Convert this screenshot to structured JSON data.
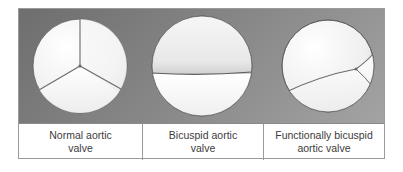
{
  "figure": {
    "panels": [
      {
        "id": "normal",
        "label_line1": "Normal aortic",
        "label_line2": "valve",
        "icon": "tricuspid-valve-icon",
        "cusps": 3
      },
      {
        "id": "bicuspid",
        "label_line1": "Bicuspid aortic",
        "label_line2": "valve",
        "icon": "bicuspid-valve-icon",
        "cusps": 2
      },
      {
        "id": "functionally-bicuspid",
        "label_line1": "Functionally bicuspid",
        "label_line2": "aortic valve",
        "icon": "functionally-bicuspid-valve-icon",
        "cusps": 3
      }
    ],
    "colors": {
      "background_band": "#858585",
      "valve_fill": "#f4f4f4",
      "commissure_line": "#6a6a6a",
      "label_text": "#3c3c3c",
      "border": "#9a9a9a"
    }
  }
}
